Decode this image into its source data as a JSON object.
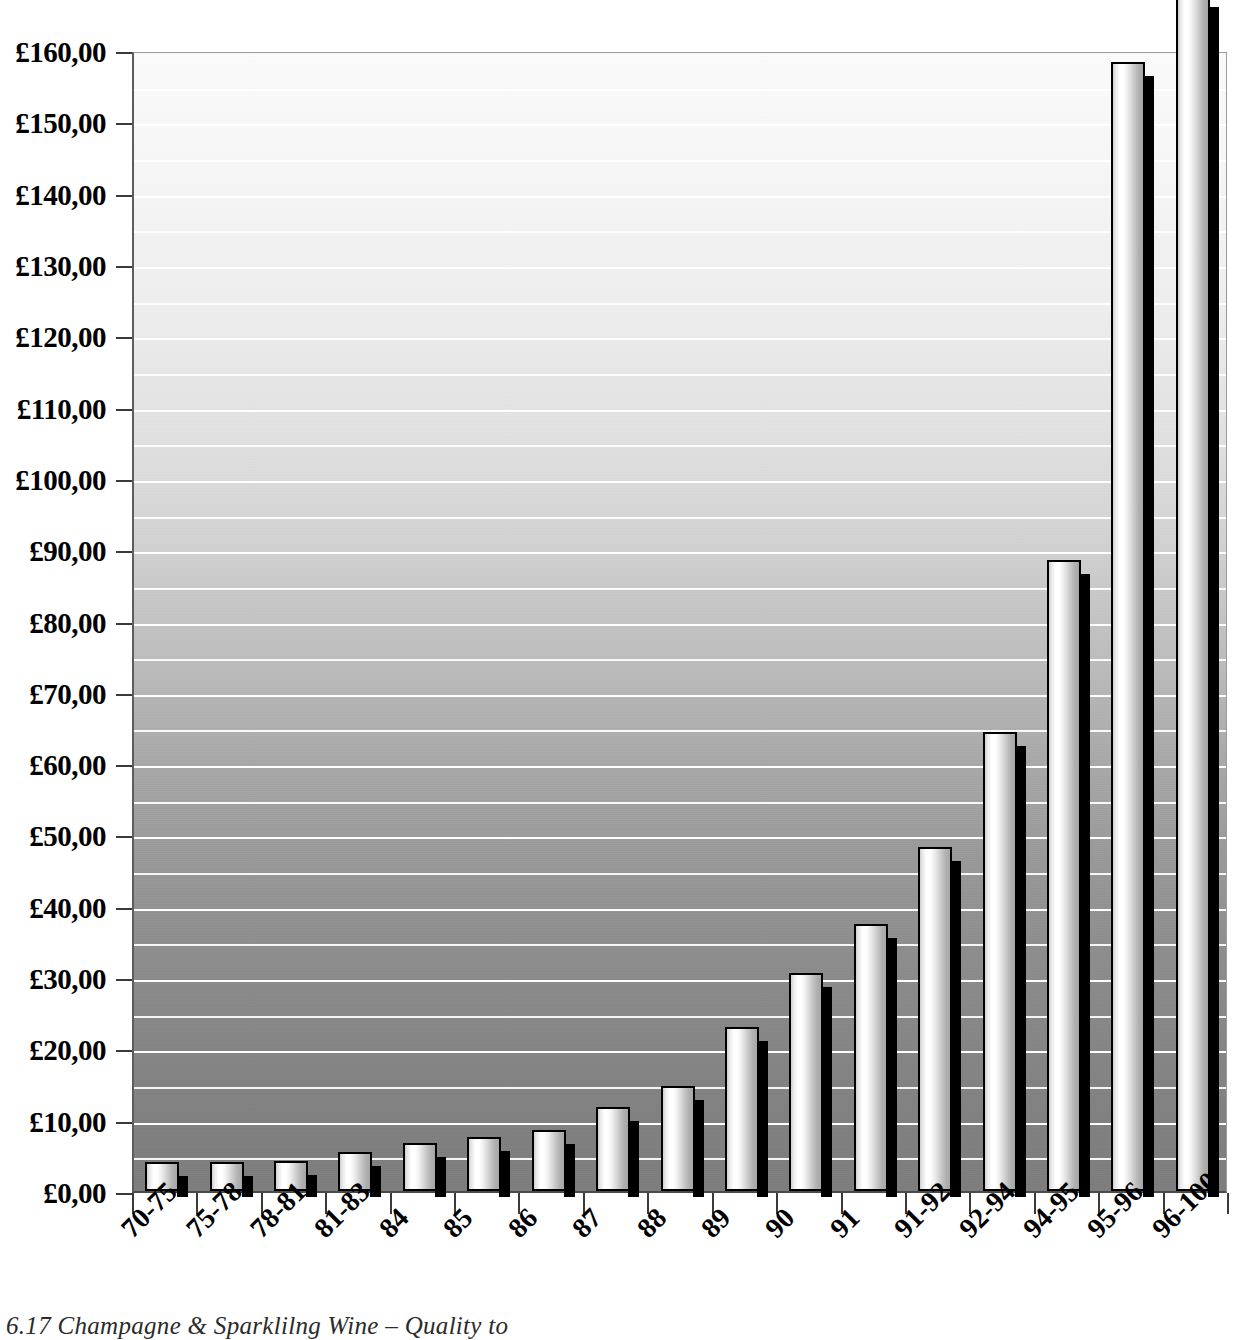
{
  "caption": "6.17  Champagne & Sparklilng Wine – Quality to",
  "axis": {
    "y_tick_labels": [
      "£160,00",
      "£150,00",
      "£140,00",
      "£130,00",
      "£120,00",
      "£110,00",
      "£100,00",
      "£90,00",
      "£80,00",
      "£70,00",
      "£60,00",
      "£50,00",
      "£40,00",
      "£30,00",
      "£20,00",
      "£10,00",
      "£0,00"
    ],
    "y_tick_values": [
      160,
      150,
      140,
      130,
      120,
      110,
      100,
      90,
      80,
      70,
      60,
      50,
      40,
      30,
      20,
      10,
      0
    ],
    "currency_symbol": "£",
    "decimal_separator": ",",
    "minor_gridline_step": 5
  },
  "colors": {
    "gridline": "#ffffff",
    "bar_outline": "#000000",
    "bar_shadow": "#000000",
    "plot_bg_top": "#fbfbfb",
    "plot_bg_bottom": "#7d7d7d",
    "axis_line": "#4a4a4a",
    "text": "#000000"
  },
  "chart_data": {
    "type": "bar",
    "title": "",
    "subtitle": "",
    "xlabel": "",
    "ylabel": "",
    "ylim": [
      0,
      160
    ],
    "ytick_step": 10,
    "grid": true,
    "legend": null,
    "categories": [
      "70-75",
      "75-78",
      "78-81",
      "81-83",
      "84",
      "85",
      "86",
      "87",
      "88",
      "89",
      "90",
      "91",
      "91-92",
      "92-94",
      "94-95",
      "95-96",
      "96-100"
    ],
    "values": [
      4.1,
      4.0,
      4.2,
      5.5,
      6.7,
      7.6,
      8.6,
      11.8,
      14.7,
      23.0,
      30.6,
      37.4,
      48.2,
      64.4,
      88.5,
      158.3,
      168.0
    ],
    "value_labels": [
      "£4,10",
      "£4,00",
      "£4,20",
      "£5,50",
      "£6,70",
      "£7,60",
      "£8,60",
      "£11,80",
      "£14,70",
      "£23,00",
      "£30,60",
      "£37,40",
      "£48,20",
      "£64,40",
      "£88,50",
      "£158,30",
      "£168,00"
    ],
    "clipped_bars": [
      "96-100"
    ],
    "annotations": [
      "Final bar (96-100) exceeds the £160,00 axis maximum and is clipped by the top of the figure."
    ]
  }
}
